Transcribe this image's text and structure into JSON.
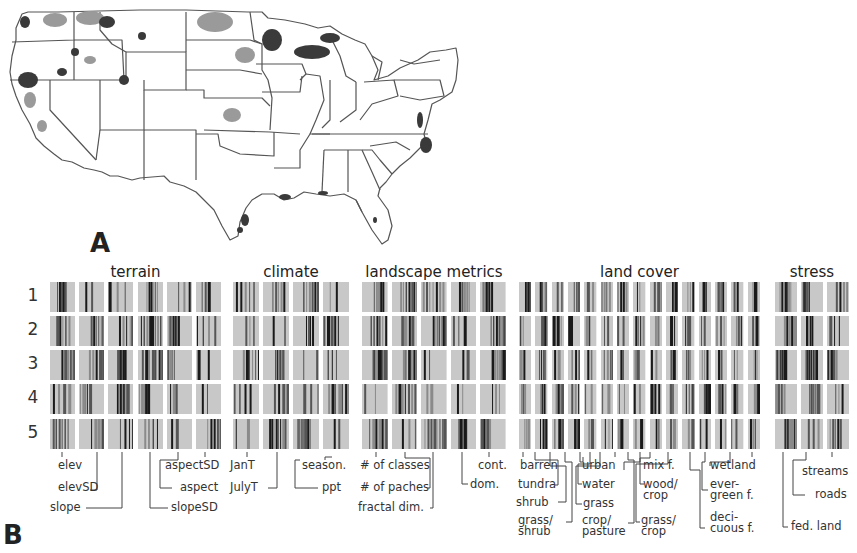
{
  "figure": {
    "panel_a_label": "A",
    "panel_b_label": "B"
  },
  "map": {
    "description": "Contiguous United States outline with state borders; shaded clusters in gray/dark gray",
    "colors": {
      "border": "#555555",
      "light_cluster": "#9a9a9a",
      "dark_cluster": "#3a3a3a",
      "background": "#ffffff"
    }
  },
  "barcode": {
    "rows": [
      "1",
      "2",
      "3",
      "4",
      "5"
    ],
    "groups": [
      {
        "title": "terrain",
        "x": 50,
        "w": 171,
        "panels": 6
      },
      {
        "title": "climate",
        "x": 233,
        "w": 116,
        "panels": 4
      },
      {
        "title": "landscape metrics",
        "x": 362,
        "w": 144,
        "panels": 5
      },
      {
        "title": "land cover",
        "x": 519,
        "w": 241,
        "panels": 15
      },
      {
        "title": "stress",
        "x": 775,
        "w": 74,
        "panels": 3
      }
    ],
    "colors": {
      "panel_bg": "#c8c8c8",
      "bar_dark": "#1a1a1a",
      "bar_mid": "#555555",
      "bar_light": "#8a8a8a"
    }
  },
  "labels": {
    "terrain": [
      "elev",
      "elevSD",
      "slope",
      "aspectSD",
      "aspect",
      "slopeSD"
    ],
    "climate": [
      "JanT",
      "JulyT",
      "season.",
      "ppt"
    ],
    "landscape": [
      "# of classes",
      "# of paches",
      "fractal dim.",
      "cont.",
      "dom."
    ],
    "land_cover": [
      "barren",
      "tundra",
      "shrub",
      "grass/",
      "shrub",
      "urban",
      "water",
      "grass",
      "crop/",
      "pasture",
      "mix f.",
      "wood/",
      "crop",
      "grass/",
      "crop",
      "wetland",
      "ever-",
      "green f.",
      "deci-",
      "cuous f."
    ],
    "stress": [
      "streams",
      "roads",
      "fed. land"
    ]
  }
}
